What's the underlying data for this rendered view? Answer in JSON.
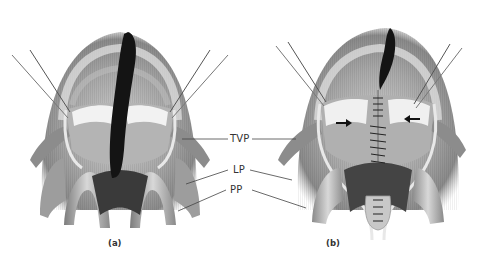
{
  "figure": {
    "panels": [
      {
        "id": "a",
        "caption": "(a)",
        "state": "cleft palate with lateral relaxing incisions, flaps elevated"
      },
      {
        "id": "b",
        "caption": "(b)",
        "state": "repaired palate with midline sutures; arrows show medial flap advancement"
      }
    ],
    "labels": [
      {
        "id": "tvp",
        "text": "TVP"
      },
      {
        "id": "lp",
        "text": "LP"
      },
      {
        "id": "pp",
        "text": "PP"
      }
    ],
    "colors": {
      "background": "#ffffff",
      "tissue_light": "#d9d9d9",
      "tissue_mid": "#9a9a9a",
      "tissue_dark": "#555555",
      "cleft": "#141414",
      "leader_line": "#444444",
      "label_text": "#333333"
    }
  }
}
